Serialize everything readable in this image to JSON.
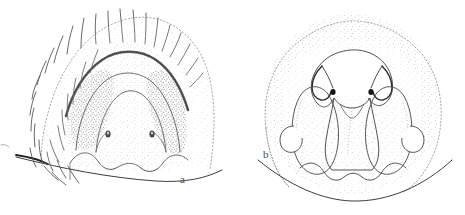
{
  "figure": {
    "type": "scientific-line-drawing",
    "medium": "stippled ink illustration",
    "background_color": "#ffffff",
    "ink_color": "#3a3a3a",
    "stipple_color": "#767676",
    "dark_accent_color": "#1a1a1a",
    "width": 465,
    "height": 215,
    "panel_count": 2
  },
  "panels": [
    {
      "id": "a",
      "label": "a",
      "label_x": 180,
      "label_y": 174,
      "subject": "hairy stippled terminal segment with arched median ridge and two setal sockets",
      "center_x": 125,
      "center_y": 100,
      "features": {
        "has_setae": true,
        "setae_count": 34,
        "has_dark_arch_band": true,
        "socket_count": 2,
        "socket_positions": [
          [
            108,
            134
          ],
          [
            152,
            134
          ]
        ],
        "has_baseline": true,
        "shaded_patch_count": 2
      }
    },
    {
      "id": "b",
      "label": "b",
      "label_x": 263,
      "label_y": 149,
      "subject": "dome shaped stippled capsule with paired lateral lobes and hooked apical processes",
      "center_x": 352,
      "center_y": 105,
      "features": {
        "has_setae": false,
        "has_dark_arch_band": false,
        "hook_count": 2,
        "hook_positions": [
          [
            333,
            78
          ],
          [
            371,
            78
          ]
        ],
        "lobe_count": 2,
        "has_baseline": true
      }
    }
  ],
  "caption": {
    "panel_a_letter": "a",
    "panel_b_letter": "b"
  }
}
